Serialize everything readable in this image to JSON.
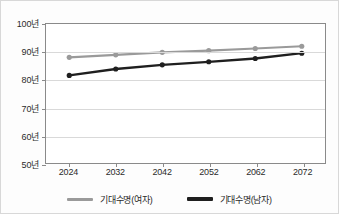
{
  "chart_data": {
    "type": "line",
    "title": "",
    "xlabel": "",
    "ylabel": "",
    "categories": [
      "2024",
      "2032",
      "2042",
      "2052",
      "2062",
      "2072"
    ],
    "x": [
      2024,
      2032,
      2042,
      2052,
      2062,
      2072
    ],
    "ylim": [
      50,
      100
    ],
    "yticks": [
      50,
      60,
      70,
      80,
      90,
      100
    ],
    "ytick_labels": [
      "50년",
      "60년",
      "70년",
      "80년",
      "90년",
      "100년"
    ],
    "xtick_labels": [
      "2024",
      "2032",
      "2042",
      "2052",
      "2062",
      "2072"
    ],
    "grid": true,
    "legend_position": "bottom-center",
    "series": [
      {
        "name": "기대수명(여자)",
        "color": "#9a9a9a",
        "marker": "circle",
        "values": [
          88.0,
          88.9,
          89.8,
          90.4,
          91.2,
          92.0
        ]
      },
      {
        "name": "기대수명(남자)",
        "color": "#1f1f1f",
        "marker": "circle",
        "values": [
          81.5,
          83.8,
          85.3,
          86.4,
          87.6,
          89.5
        ]
      }
    ]
  },
  "legend": {
    "items": [
      {
        "label": "기대수명(여자)",
        "color": "#9a9a9a"
      },
      {
        "label": "기대수명(남자)",
        "color": "#1f1f1f"
      }
    ]
  },
  "colors": {
    "female_series": "#9a9a9a",
    "male_series": "#1f1f1f",
    "gridline": "#d9d9d9",
    "axis": "#8a8a8a",
    "text": "#2b2b2b",
    "background": "#fdfdfd",
    "plot_background": "#ffffff"
  }
}
